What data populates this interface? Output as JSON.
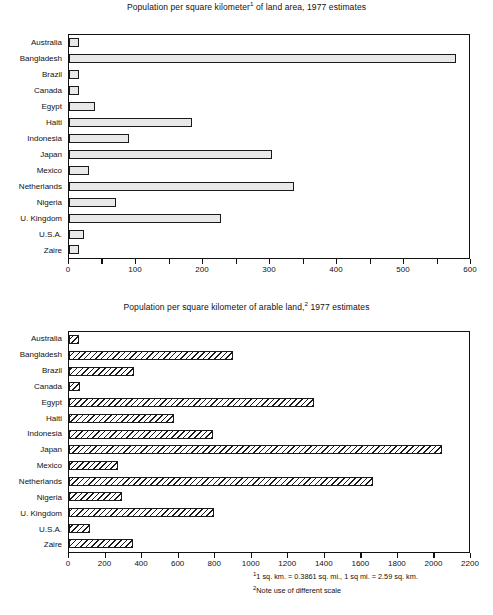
{
  "figure": {
    "footnotes": [
      {
        "marker": "1",
        "text": "1 sq. km. = 0.3861 sq. mi., 1 sq mi. = 2.59 sq. km."
      },
      {
        "marker": "2",
        "text": "Note use of different scale"
      }
    ]
  },
  "chart_data": [
    {
      "id": "land-area",
      "type": "bar",
      "orientation": "horizontal",
      "title_parts": {
        "before": "Population per square kilometer",
        "marker": "1",
        "after": " of land area, 1977 estimates"
      },
      "title": "Population per square kilometer¹ of land area, 1977 estimates",
      "xlabel": "",
      "ylabel": "",
      "xlim": [
        0,
        600
      ],
      "xticks": [
        0,
        50,
        100,
        150,
        200,
        250,
        300,
        350,
        400,
        450,
        500,
        550,
        600
      ],
      "xticklabels": [
        "0",
        "",
        "100",
        "",
        "200",
        "",
        "300",
        "",
        "400",
        "",
        "500",
        "",
        "600"
      ],
      "grid": false,
      "legend": "none",
      "bar_style": "solid-light-gray",
      "categories": [
        "Australia",
        "Bangladesh",
        "Brazil",
        "Canada",
        "Egypt",
        "Haiti",
        "Indonesia",
        "Japan",
        "Mexico",
        "Netherlands",
        "Nigeria",
        "U. Kingdom",
        "U.S.A.",
        "Zaire"
      ],
      "values": [
        2,
        580,
        13,
        2,
        39,
        185,
        90,
        305,
        30,
        338,
        70,
        228,
        23,
        11
      ]
    },
    {
      "id": "arable-land",
      "type": "bar",
      "orientation": "horizontal",
      "title_parts": {
        "before": "Population per square kilometer of arable land,",
        "marker": "2",
        "after": " 1977 estimates"
      },
      "title": "Population per square kilometer of arable land,² 1977 estimates",
      "xlabel": "",
      "ylabel": "",
      "xlim": [
        0,
        2200
      ],
      "xticks": [
        0,
        200,
        400,
        600,
        800,
        1000,
        1200,
        1400,
        1600,
        1800,
        2000,
        2200
      ],
      "xticklabels": [
        "0",
        "200",
        "400",
        "600",
        "800",
        "1000",
        "1200",
        "1400",
        "1600",
        "1800",
        "2000",
        "2200"
      ],
      "grid": false,
      "legend": "none",
      "bar_style": "diagonal-hatch",
      "categories": [
        "Australia",
        "Bangladesh",
        "Brazil",
        "Canada",
        "Egypt",
        "Haiti",
        "Indonesia",
        "Japan",
        "Mexico",
        "Netherlands",
        "Nigeria",
        "U. Kingdom",
        "U.S.A.",
        "Zaire"
      ],
      "values": [
        40,
        900,
        355,
        60,
        1350,
        575,
        790,
        2050,
        270,
        1670,
        290,
        800,
        115,
        350
      ]
    }
  ]
}
